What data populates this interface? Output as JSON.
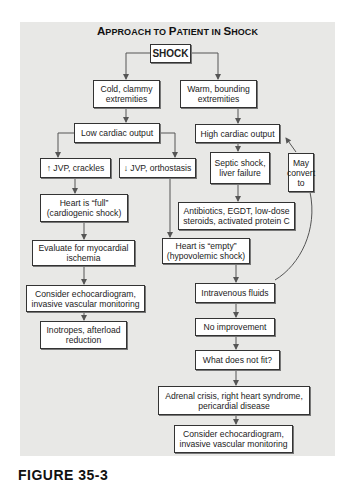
{
  "figure": {
    "title_parts": [
      {
        "cap": "A",
        "rest": "PPROACH TO "
      },
      {
        "cap": "P",
        "rest": "ATIENT IN "
      },
      {
        "cap": "S",
        "rest": "HOCK"
      }
    ],
    "title": "Approach to Patient in Shock",
    "caption": "FIGURE 35-3"
  },
  "nodes": {
    "shock": "SHOCK",
    "cold": "Cold, clammy extremities",
    "warm": "Warm, bounding extremities",
    "low_co": "Low cardiac output",
    "high_co": "High cardiac output",
    "jvp_up": "↑ JVP, crackles",
    "jvp_down": "↓ JVP, orthostasis",
    "septic": "Septic shock, liver failure",
    "may_convert": "May convert to",
    "heart_full": "Heart is “full” (cardiogenic shock)",
    "antibiotics": "Antibiotics, EGDT, low-dose steroids, activated protein C",
    "evaluate": "Evaluate for myocardial ischemia",
    "heart_empty": "Heart is “empty” (hypovolemic shock)",
    "echo_left": "Consider echocardiogram, invasive vascular monitoring",
    "iv_fluids": "Intravenous fluids",
    "no_improvement": "No improvement",
    "inotropes": "Inotropes, afterload reduction",
    "what_not_fit": "What does not fit?",
    "adrenal": "Adrenal crisis, right heart syndrome, pericardial disease",
    "echo_right": "Consider echocardiogram, invasive vascular monitoring"
  },
  "colors": {
    "panel_bg": "#e8e8e6",
    "box_bg": "#ffffff",
    "line": "#555555"
  }
}
